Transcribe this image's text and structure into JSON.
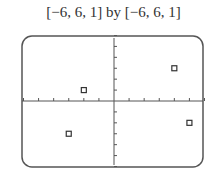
{
  "header": {
    "window_label": "[−6, 6, 1] by [−6, 6, 1]"
  },
  "chart_data": {
    "type": "scatter",
    "title": "[−6, 6, 1] by [−6, 6, 1]",
    "xlabel": "",
    "ylabel": "",
    "xlim": [
      -6,
      6
    ],
    "ylim": [
      -6,
      6
    ],
    "xscale": 1,
    "yscale": 1,
    "grid": false,
    "marker": "open-square",
    "points": [
      {
        "x": -2,
        "y": 1
      },
      {
        "x": 4,
        "y": 3
      },
      {
        "x": 5,
        "y": -2
      },
      {
        "x": -3,
        "y": -3
      }
    ]
  },
  "colors": {
    "frame": "#555555",
    "axis": "#555555",
    "marker": "#333333"
  }
}
